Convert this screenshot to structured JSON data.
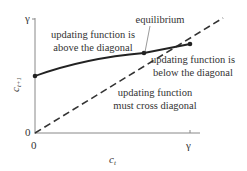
{
  "diagram": {
    "axes": {
      "x_label": "c",
      "x_label_sub": "t",
      "y_label": "c",
      "y_label_sub": "t+1",
      "x_ticks": [
        "0",
        "γ"
      ],
      "y_ticks": [
        "0",
        "γ"
      ]
    },
    "annotations": {
      "equilibrium": "equilibrium",
      "above_line1": "updating function is",
      "above_line2": "above the diagonal",
      "below_line1": "updating function is",
      "below_line2": "below the diagonal",
      "cross_line1": "updating function",
      "cross_line2": "must cross diagonal"
    },
    "colors": {
      "curve": "#222222",
      "diagonal": "#333333",
      "axes": "#888888",
      "text": "#333333"
    }
  }
}
